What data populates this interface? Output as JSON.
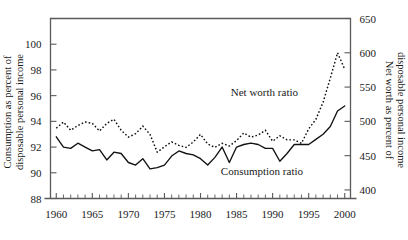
{
  "chart_data": {
    "type": "line",
    "title": "",
    "xlabel": "",
    "ylabel": "Consumption as percent of disposable personal income",
    "ylabel_right": "Net worth as percent of disposable personal income",
    "grid": false,
    "legend_position": "inline-annotation",
    "x": [
      1960,
      1961,
      1962,
      1963,
      1964,
      1965,
      1966,
      1967,
      1968,
      1969,
      1970,
      1971,
      1972,
      1973,
      1974,
      1975,
      1976,
      1977,
      1978,
      1979,
      1980,
      1981,
      1982,
      1983,
      1984,
      1985,
      1986,
      1987,
      1988,
      1989,
      1990,
      1991,
      1992,
      1993,
      1994,
      1995,
      1996,
      1997,
      1998,
      1999,
      2000
    ],
    "xlim": [
      1959.2,
      2000.8
    ],
    "xticks_major": [
      1960,
      1965,
      1970,
      1975,
      1980,
      1985,
      1990,
      1995,
      2000
    ],
    "xtick_labels": [
      "1960",
      "1965",
      "1970",
      "1975",
      "1980",
      "1985",
      "1990",
      "1995",
      "2000"
    ],
    "xticks_minor_step": 1,
    "ylim_left": [
      88,
      102
    ],
    "yticks_left": [
      88,
      90,
      92,
      94,
      96,
      98,
      100,
      102
    ],
    "ytick_labels_left": [
      "88",
      "90",
      "92",
      "94",
      "96",
      "98",
      "100",
      ""
    ],
    "ylim_right": [
      387.5,
      650
    ],
    "yticks_right": [
      400,
      450,
      500,
      550,
      600,
      650
    ],
    "ytick_labels_right": [
      "400",
      "450",
      "500",
      "550",
      "600",
      "650"
    ],
    "series": [
      {
        "name": "Consumption ratio",
        "style": "solid",
        "axis": "left",
        "units": "percent of disposable personal income",
        "annotation": "Consumption ratio",
        "values": [
          92.8,
          92.0,
          91.9,
          92.3,
          92.0,
          91.7,
          91.8,
          91.0,
          91.6,
          91.5,
          90.8,
          90.6,
          91.1,
          90.3,
          90.4,
          90.6,
          91.3,
          91.7,
          91.5,
          91.4,
          91.1,
          90.6,
          91.2,
          92.0,
          90.8,
          92.0,
          92.2,
          92.3,
          92.2,
          91.9,
          91.9,
          90.9,
          91.5,
          92.2,
          92.2,
          92.2,
          92.6,
          93.0,
          93.6,
          94.8,
          95.2
        ]
      },
      {
        "name": "Net worth ratio",
        "style": "dotted",
        "axis": "right",
        "units": "percent of disposable personal income",
        "annotation": "Net worth ratio",
        "values": [
          490,
          499,
          487,
          494,
          499,
          497,
          486,
          497,
          503,
          487,
          477,
          482,
          493,
          481,
          455,
          463,
          470,
          465,
          462,
          470,
          481,
          467,
          462,
          468,
          464,
          472,
          483,
          477,
          480,
          487,
          471,
          479,
          473,
          473,
          468,
          489,
          503,
          528,
          563,
          600,
          576
        ]
      }
    ]
  }
}
